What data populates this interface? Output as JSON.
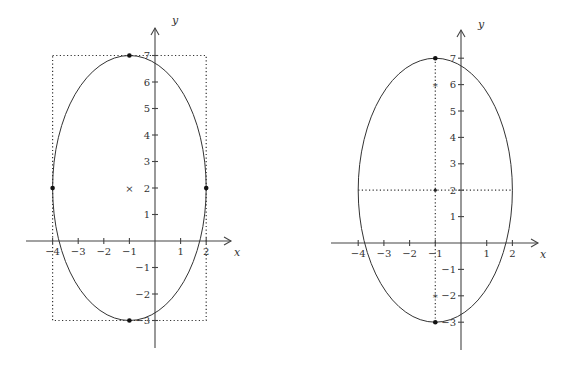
{
  "chart_data": [
    {
      "type": "line",
      "title": "",
      "description": "Ellipse with center (-1,2), semi-axes 3 (horizontal) and 5 (vertical), inscribed in dotted bounding rectangle",
      "xlabel": "x",
      "ylabel": "y",
      "xlim": [
        -5,
        3
      ],
      "ylim": [
        -4,
        8
      ],
      "grid": false,
      "x_ticks": [
        "-4",
        "-3",
        "-2",
        "-1",
        "1",
        "2"
      ],
      "y_ticks": [
        "-3",
        "-2",
        "-1",
        "1",
        "2",
        "3",
        "4",
        "5",
        "6",
        "7"
      ],
      "ellipse": {
        "center": [
          -1,
          2
        ],
        "a": 3,
        "b": 5
      },
      "center_marker": {
        "x": -1,
        "y": 2,
        "symbol": "×"
      },
      "vertices": [
        [
          -1,
          7
        ],
        [
          -1,
          -3
        ],
        [
          -4,
          2
        ],
        [
          2,
          2
        ]
      ],
      "bounding_box": {
        "x": [
          -4,
          2
        ],
        "y": [
          -3,
          7
        ],
        "style": "dotted"
      }
    },
    {
      "type": "line",
      "title": "",
      "description": "Same ellipse showing major/minor axes (dotted) and foci",
      "xlabel": "x",
      "ylabel": "y",
      "xlim": [
        -5,
        3
      ],
      "ylim": [
        -4,
        8
      ],
      "grid": false,
      "x_ticks": [
        "-4",
        "-3",
        "-2",
        "-1",
        "1",
        "2"
      ],
      "y_ticks": [
        "-3",
        "-2",
        "-1",
        "1",
        "2",
        "3",
        "4",
        "5",
        "6",
        "7"
      ],
      "ellipse": {
        "center": [
          -1,
          2
        ],
        "a": 3,
        "b": 5
      },
      "vertices": [
        [
          -1,
          7
        ],
        [
          -1,
          -3
        ]
      ],
      "foci": [
        [
          -1,
          6
        ],
        [
          -1,
          -2
        ]
      ],
      "center_marker": {
        "x": -1,
        "y": 2
      },
      "major_axis": {
        "from": [
          -1,
          7
        ],
        "to": [
          -1,
          -3
        ],
        "style": "dotted"
      },
      "minor_axis": {
        "from": [
          -4,
          2
        ],
        "to": [
          2,
          2
        ],
        "style": "dotted"
      }
    }
  ],
  "labels": {
    "x_axis": "x",
    "y_axis": "y",
    "center_marker": "×",
    "focus_marker": "*"
  }
}
